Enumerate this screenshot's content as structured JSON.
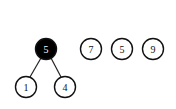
{
  "diagram": {
    "type": "heap-forest",
    "tree": {
      "root": {
        "label": "5",
        "filled": true
      },
      "children": [
        {
          "label": "1",
          "filled": false
        },
        {
          "label": "4",
          "filled": false
        }
      ]
    },
    "singletons": [
      {
        "label": "7"
      },
      {
        "label": "5"
      },
      {
        "label": "9"
      }
    ]
  }
}
